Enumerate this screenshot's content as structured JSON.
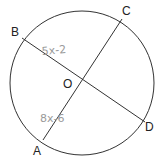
{
  "diagram": {
    "type": "circle-with-diameters",
    "center_label": "O",
    "points": {
      "A": "A",
      "B": "B",
      "C": "C",
      "D": "D"
    },
    "segments": [
      {
        "name": "BD",
        "from": "B",
        "to": "D"
      },
      {
        "name": "AC",
        "from": "A",
        "to": "C"
      }
    ],
    "annotations": {
      "BO": "5x-2",
      "AO": "8x-6"
    },
    "colors": {
      "stroke": "#333333",
      "handwriting": "#9a9a9a"
    }
  }
}
